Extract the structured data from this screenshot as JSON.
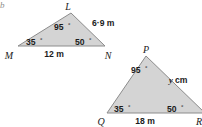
{
  "figure": {
    "background_color": "#ffffff",
    "fill_color": "#d4d4d4",
    "stroke_color": "#8c8c8c",
    "corner_fragment": "b"
  },
  "triangles": [
    {
      "name": "LMN",
      "vertices": [
        {
          "label": "L",
          "x": 71,
          "y": 13
        },
        {
          "label": "M",
          "x": 18,
          "y": 46
        },
        {
          "label": "N",
          "x": 105,
          "y": 46
        }
      ],
      "vertex_labels": [
        {
          "text": "L",
          "x": 68,
          "y": 10
        },
        {
          "text": "M",
          "x": 9,
          "y": 58
        },
        {
          "text": "N",
          "x": 106,
          "y": 58
        }
      ],
      "angles": [
        {
          "at": "L",
          "value": "95",
          "unit": "°",
          "x": 59,
          "y": 27
        },
        {
          "at": "M",
          "value": "35",
          "unit": "°",
          "x": 31,
          "y": 43
        },
        {
          "at": "N",
          "value": "50",
          "unit": "°",
          "x": 79,
          "y": 43
        }
      ],
      "sides": [
        {
          "name": "LN",
          "label": "6·9 m",
          "x": 90,
          "y": 25
        },
        {
          "name": "MN",
          "label": "12 m",
          "x": 53,
          "y": 56
        }
      ]
    },
    {
      "name": "PQR",
      "vertices": [
        {
          "label": "P",
          "x": 146,
          "y": 56
        },
        {
          "label": "Q",
          "x": 107,
          "y": 113
        },
        {
          "label": "R",
          "x": 201,
          "y": 113
        }
      ],
      "vertex_labels": [
        {
          "text": "P",
          "x": 143,
          "y": 53
        },
        {
          "text": "Q",
          "x": 99,
          "y": 124
        },
        {
          "text": "R",
          "x": 196,
          "y": 124
        }
      ],
      "angles": [
        {
          "at": "P",
          "value": "95",
          "unit": "°",
          "x": 136,
          "y": 70
        },
        {
          "at": "Q",
          "value": "35",
          "unit": "°",
          "x": 119,
          "y": 110
        },
        {
          "at": "R",
          "value": "50",
          "unit": "°",
          "x": 172,
          "y": 110
        }
      ],
      "sides": [
        {
          "name": "PR",
          "label": "y cm",
          "variable": "y",
          "units": "cm",
          "x": 170,
          "y": 82
        },
        {
          "name": "QR",
          "label": "18 m",
          "x": 142,
          "y": 123
        }
      ]
    }
  ],
  "labels": {
    "tri1_vertex_L": "L",
    "tri1_vertex_M": "M",
    "tri1_vertex_N": "N",
    "tri1_angle_L": "95",
    "tri1_angle_M": "35",
    "tri1_angle_N": "50",
    "tri1_side_LN": "6·9 m",
    "tri1_side_MN": "12 m",
    "tri2_vertex_P": "P",
    "tri2_vertex_Q": "Q",
    "tri2_vertex_R": "R",
    "tri2_angle_P": "95",
    "tri2_angle_Q": "35",
    "tri2_angle_R": "50",
    "tri2_side_PR_var": "y",
    "tri2_side_PR_unit": "cm",
    "tri2_side_QR": "18 m",
    "degree_symbol": "°",
    "corner_fragment": "b"
  }
}
